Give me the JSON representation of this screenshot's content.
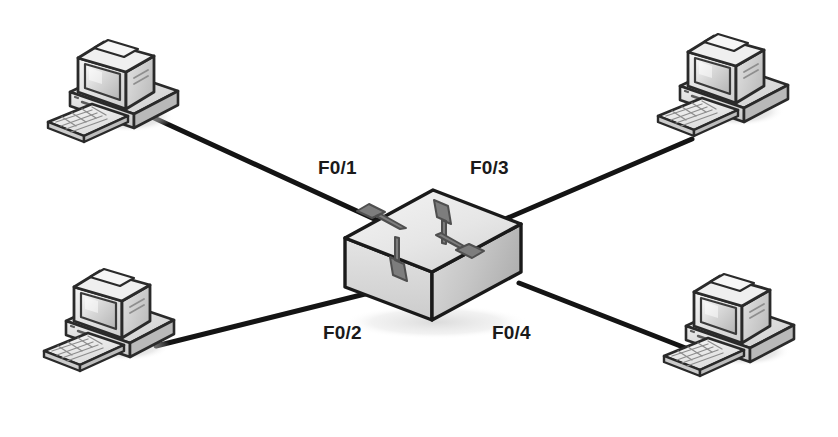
{
  "diagram": {
    "type": "network-topology",
    "background_color": "#ffffff",
    "link_color": "#141414",
    "switch": {
      "name": "ethernet-switch",
      "icon": "switch-icon",
      "top_face_color": "#ececec",
      "left_face_color": "#dcdcdc",
      "right_face_color": "#c4c4c4",
      "outline_color": "#1a1a1a",
      "arrow_color": "#7a7a7a",
      "arrow_outline_color": "#4a4a4a",
      "arrow_count": 4
    },
    "hosts": [
      {
        "id": "pc-top-left",
        "icon": "desktop-computer-icon",
        "port": "F0/1"
      },
      {
        "id": "pc-bottom-left",
        "icon": "desktop-computer-icon",
        "port": "F0/2"
      },
      {
        "id": "pc-top-right",
        "icon": "desktop-computer-icon",
        "port": "F0/3"
      },
      {
        "id": "pc-bottom-right",
        "icon": "desktop-computer-icon",
        "port": "F0/4"
      }
    ],
    "links": [
      {
        "id": "link-f01",
        "from": "pc-top-left",
        "to": "ethernet-switch",
        "label": "F0/1"
      },
      {
        "id": "link-f02",
        "from": "pc-bottom-left",
        "to": "ethernet-switch",
        "label": "F0/2"
      },
      {
        "id": "link-f03",
        "from": "pc-top-right",
        "to": "ethernet-switch",
        "label": "F0/3"
      },
      {
        "id": "link-f04",
        "from": "pc-bottom-right",
        "to": "ethernet-switch",
        "label": "F0/4"
      }
    ],
    "labels": {
      "f01": "F0/1",
      "f02": "F0/2",
      "f03": "F0/3",
      "f04": "F0/4"
    }
  }
}
